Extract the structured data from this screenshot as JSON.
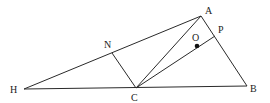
{
  "diagram": {
    "type": "geometry",
    "colors": {
      "line": "#2a2a2a",
      "text": "#222222",
      "point": "#111111",
      "background": "#ffffff"
    },
    "points": {
      "A": {
        "label": "A",
        "x": 201,
        "y": 16,
        "lx": 205,
        "ly": 14
      },
      "B": {
        "label": "B",
        "x": 247,
        "y": 86,
        "lx": 250,
        "ly": 92
      },
      "C": {
        "label": "C",
        "x": 136,
        "y": 88,
        "lx": 131,
        "ly": 101
      },
      "H": {
        "label": "H",
        "x": 24,
        "y": 89,
        "lx": 10,
        "ly": 93
      },
      "N": {
        "label": "N",
        "x": 112,
        "y": 53,
        "lx": 104,
        "ly": 48
      },
      "P": {
        "label": "P",
        "x": 215,
        "y": 36,
        "lx": 218,
        "ly": 33
      },
      "O": {
        "label": "O",
        "x": 197,
        "y": 46,
        "lx": 192,
        "ly": 41
      }
    },
    "segments": [
      {
        "from": "H",
        "to": "A"
      },
      {
        "from": "H",
        "to": "B"
      },
      {
        "from": "A",
        "to": "B"
      },
      {
        "from": "A",
        "to": "C"
      },
      {
        "from": "C",
        "to": "P"
      },
      {
        "from": "N",
        "to": "C"
      }
    ],
    "marked_points": [
      "O"
    ]
  }
}
